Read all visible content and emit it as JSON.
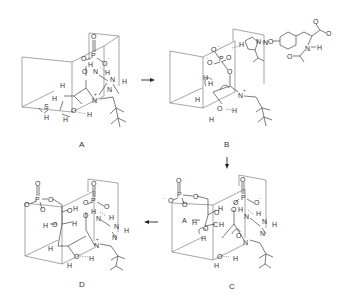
{
  "figure": {
    "type": "reaction-mechanism",
    "panels": [
      {
        "id": "A",
        "label": "A",
        "atoms": {
          "o_double": "O",
          "p": "P",
          "o_bridge": "O",
          "o_minus": "O",
          "minus": "-",
          "h_n": "H",
          "n_amide": "N",
          "h_nh2": "H",
          "n_nh": "N",
          "h_nh": "H",
          "o_carbonyl": "O",
          "h1": "H",
          "h2": "H",
          "n_plus": "N",
          "plus": "+",
          "n_ring": "N",
          "s": "S",
          "h_s": "H",
          "o_hydroxyl": "O",
          "h_o": "H",
          "h_n2": "H"
        }
      },
      {
        "id": "B",
        "label": "B",
        "atoms": {
          "o_top": "O",
          "minus1": "-",
          "o_left": "O",
          "p": "P",
          "o_right": "O",
          "minus2": "-",
          "o_bridge": "O",
          "h_dot": "H",
          "h1": "H",
          "h2": "H",
          "n_plus": "N",
          "plus": "+",
          "o_hydroxyl": "O",
          "h_o": "H",
          "h_n": "H",
          "h_im": "H",
          "n_im": "N",
          "n_im2": "N",
          "o_ether": "O",
          "o_acid1": "O",
          "o_acid2": "O",
          "n_amide": "N",
          "h_amide": "H",
          "o_acetyl": "O"
        }
      },
      {
        "id": "C",
        "label": "C",
        "atoms": {
          "o1": "O",
          "p1": "P",
          "o2": "O",
          "o3": "O",
          "o4": "O",
          "minus1": "-",
          "minus2": "-",
          "h_oh": "H",
          "o_oh": "O",
          "a_acid": "A",
          "h_a": "H",
          "o_ring": "O",
          "c_enol": "C",
          "h_c": "H",
          "h1": "H",
          "o_top": "O",
          "p2": "P",
          "o_left": "O",
          "o_right": "O",
          "minus3": "-",
          "o_bridge": "O",
          "h_n": "H",
          "n_amide": "N",
          "h_nh2": "H",
          "n_nh": "N",
          "h_nh": "H",
          "n_ring": "N",
          "n_im": "N",
          "o_hydroxyl": "O",
          "h_o": "H",
          "h_n2": "H",
          "o_ring2": "O"
        }
      },
      {
        "id": "D",
        "label": "D",
        "atoms": {
          "o1": "O",
          "p1": "P",
          "o2": "O",
          "o3": "O",
          "o4": "O",
          "o_oh": "O",
          "h_oh": "H",
          "h_o2": "H",
          "o2b": "O",
          "h_c": "H",
          "o_top": "O",
          "p2": "P",
          "o_left": "O",
          "o_right": "O",
          "h_n": "H",
          "n_amide": "N",
          "h_nh2": "H",
          "n_nh": "N",
          "h_nh": "H",
          "o_carbonyl": "O",
          "n_ring": "N",
          "n_plus": "N",
          "plus": "+",
          "h1": "H",
          "o_hydroxyl": "O",
          "h_o": "H",
          "h_n2": "H"
        }
      }
    ],
    "arrows": [
      {
        "from": "A",
        "to": "B",
        "direction": "right"
      },
      {
        "from": "B",
        "to": "C",
        "direction": "down"
      },
      {
        "from": "C",
        "to": "D",
        "direction": "left"
      }
    ]
  }
}
